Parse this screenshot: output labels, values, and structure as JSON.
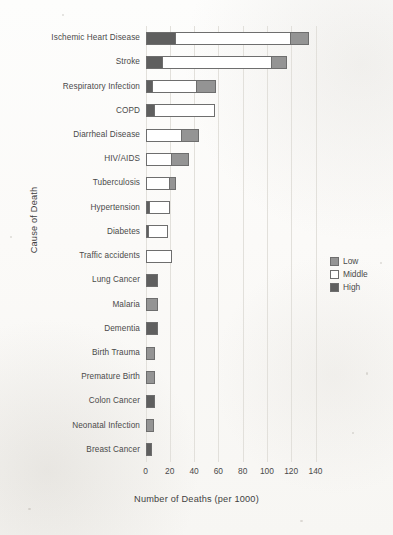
{
  "chart_data": {
    "type": "bar",
    "orientation": "horizontal",
    "stacked": true,
    "title": "",
    "xlabel": "Number of Deaths (per 1000)",
    "ylabel": "Cause of Death",
    "xlim": [
      0,
      145
    ],
    "xticks": [
      0,
      20,
      40,
      60,
      80,
      100,
      120,
      140
    ],
    "xtick_labels": [
      "0",
      "20",
      "40",
      "60",
      "80",
      "100",
      "120",
      "140"
    ],
    "grid": true,
    "legend_position": "right",
    "categories": [
      "Ischemic Heart Disease",
      "Stroke",
      "Respiratory Infection",
      "COPD",
      "Diarrheal Disease",
      "HIV/AIDS",
      "Tuberculosis",
      "Hypertension",
      "Diabetes",
      "Traffic accidents",
      "Lung Cancer",
      "Malaria",
      "Dementia",
      "Birth Trauma",
      "Premature Birth",
      "Colon Cancer",
      "Neonatal Infection",
      "Breast Cancer"
    ],
    "series": [
      {
        "name": "High",
        "color": "#5f5f5f",
        "values": [
          25,
          14,
          6,
          8,
          0,
          0,
          0,
          4,
          3,
          0,
          10,
          0,
          10,
          0,
          0,
          8,
          0,
          5
        ]
      },
      {
        "name": "Middle",
        "color": "#ffffff",
        "values": [
          96,
          91,
          37,
          50,
          30,
          22,
          20,
          17,
          16,
          22,
          0,
          0,
          0,
          0,
          0,
          0,
          0,
          0
        ]
      },
      {
        "name": "Low",
        "color": "#949494",
        "values": [
          15,
          13,
          17,
          0,
          15,
          15,
          6,
          0,
          0,
          0,
          0,
          10,
          0,
          8,
          8,
          0,
          7,
          0
        ]
      }
    ],
    "totals": [
      136,
      118,
      60,
      58,
      45,
      37,
      26,
      21,
      19,
      22,
      10,
      10,
      10,
      8,
      8,
      8,
      7,
      5
    ],
    "legend": [
      {
        "label": "Low",
        "color": "#949494"
      },
      {
        "label": "Middle",
        "color": "#ffffff"
      },
      {
        "label": "High",
        "color": "#5f5f5f"
      }
    ]
  }
}
